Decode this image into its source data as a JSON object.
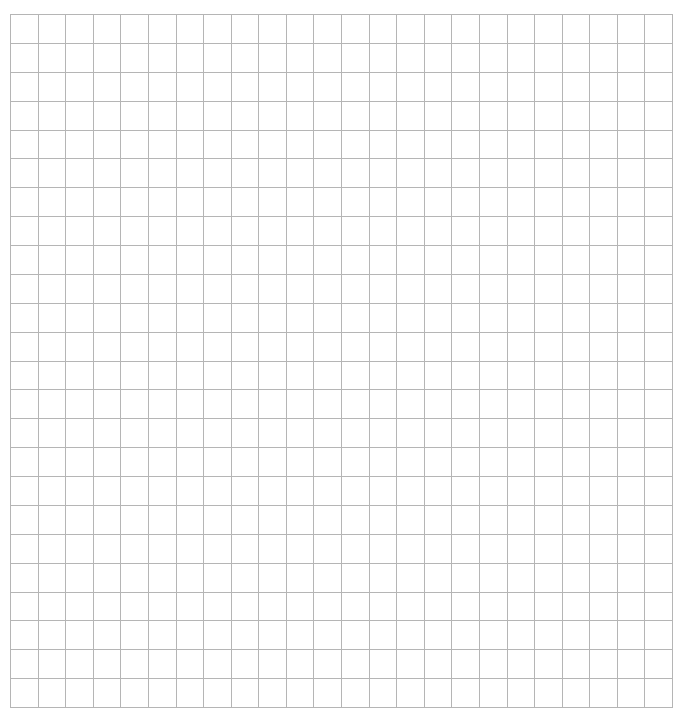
{
  "grid": {
    "columns": 24,
    "rows": 24,
    "line_color": "#b5b5b5",
    "background": "#ffffff"
  }
}
